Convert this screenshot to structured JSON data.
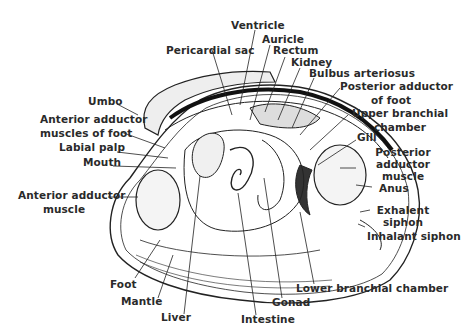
{
  "diagram": {
    "labels": {
      "ventricle": "Ventricle",
      "auricle": "Auricle",
      "pericardial_sac": "Pericardial sac",
      "rectum": "Rectum",
      "kidney": "Kidney",
      "bulbus_arteriosus": "Bulbus arteriosus",
      "posterior_adductor_of_foot_1": "Posterior adductor",
      "posterior_adductor_of_foot_2": "of foot",
      "upper_branchial_chamber_1": "Upper branchial",
      "upper_branchial_chamber_2": "chamber",
      "gill": "Gill",
      "posterior_adductor_muscle_1": "Posterior",
      "posterior_adductor_muscle_2": "adductor",
      "posterior_adductor_muscle_3": "muscle",
      "anus": "Anus",
      "exhalent_siphon_1": "Exhalent",
      "exhalent_siphon_2": "siphon",
      "inhalant_siphon": "Inhalant siphon",
      "umbo": "Umbo",
      "anterior_adductor_muscles_of_foot_1": "Anterior adductor",
      "anterior_adductor_muscles_of_foot_2": "muscles of foot",
      "labial_palp": "Labial palp",
      "mouth": "Mouth",
      "anterior_adductor_muscle_1": "Anterior adductor",
      "anterior_adductor_muscle_2": "muscle",
      "foot": "Foot",
      "mantle": "Mantle",
      "liver": "Liver",
      "intestine": "Intestine",
      "gonad": "Gonad",
      "lower_branchial_chamber": "Lower branchial chamber"
    }
  }
}
